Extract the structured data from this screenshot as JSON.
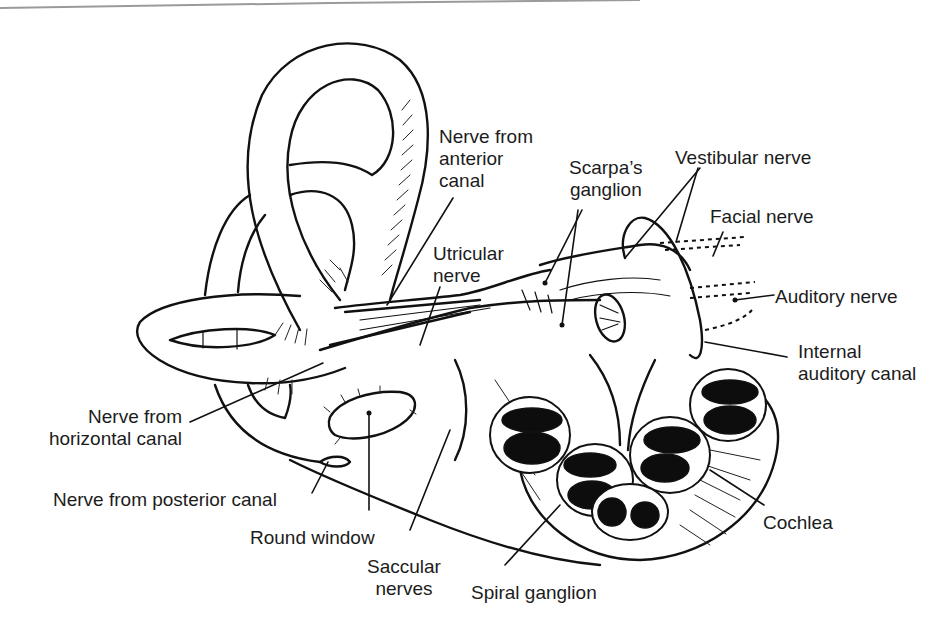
{
  "figure": {
    "colors": {
      "ink": "#111111",
      "label_text": "#1c1c1c",
      "background": "#ffffff",
      "scan_edge": "#9a9a9a"
    }
  },
  "labels": {
    "nerve_anterior_canal": "Nerve from\nanterior\ncanal",
    "scarpas_ganglion": "Scarpa’s\nganglion",
    "vestibular_nerve": "Vestibular nerve",
    "facial_nerve": "Facial nerve",
    "utricular_nerve": "Utricular\nnerve",
    "auditory_nerve": "Auditory nerve",
    "internal_auditory_canal": "Internal\nauditory canal",
    "nerve_horizontal_canal": "Nerve from\nhorizontal canal",
    "nerve_posterior_canal": "Nerve from posterior canal",
    "round_window": "Round window",
    "saccular_nerves": "Saccular\nnerves",
    "spiral_ganglion": "Spiral ganglion",
    "cochlea": "Cochlea"
  }
}
